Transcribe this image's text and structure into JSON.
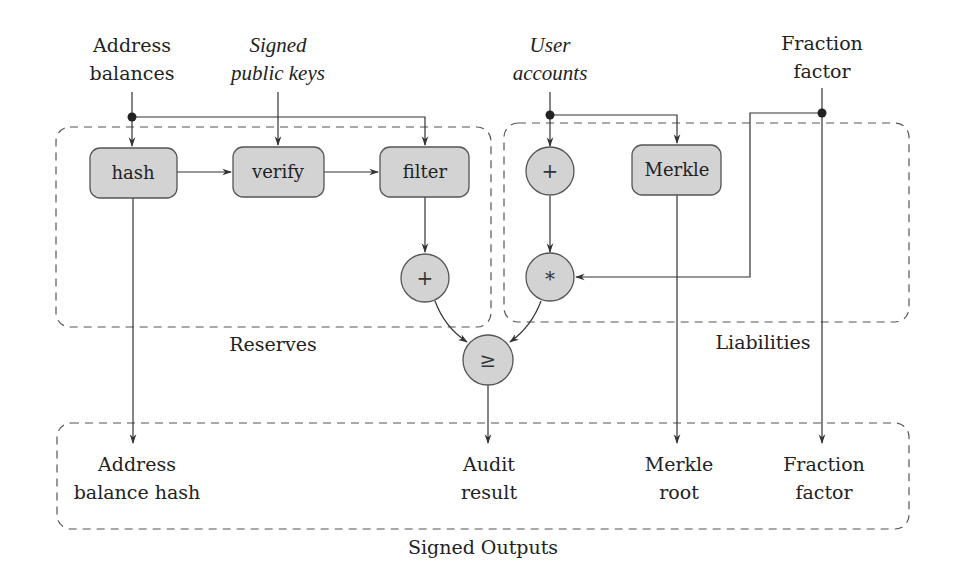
{
  "diagram": {
    "inputs": {
      "address_balances": {
        "line1": "Address",
        "line2": "balances"
      },
      "signed_public_keys": {
        "line1": "Signed",
        "line2": "public keys"
      },
      "user_accounts": {
        "line1": "User",
        "line2": "accounts"
      },
      "fraction_factor": {
        "line1": "Fraction",
        "line2": "factor"
      }
    },
    "groups": {
      "reserves": "Reserves",
      "liabilities": "Liabilities",
      "signed_outputs": "Signed Outputs"
    },
    "nodes": {
      "hash": "hash",
      "verify": "verify",
      "filter": "filter",
      "reserves_sum": "+",
      "liabilities_sum": "+",
      "merkle": "Merkle",
      "multiply": "*",
      "compare": "≥"
    },
    "outputs": {
      "address_balance_hash": {
        "line1": "Address",
        "line2": "balance hash"
      },
      "audit_result": {
        "line1": "Audit",
        "line2": "result"
      },
      "merkle_root": {
        "line1": "Merkle",
        "line2": "root"
      },
      "fraction_factor": {
        "line1": "Fraction",
        "line2": "factor"
      }
    },
    "colors": {
      "node_fill": "#d3d3d3",
      "stroke": "#333333",
      "group_border": "#555555"
    }
  }
}
